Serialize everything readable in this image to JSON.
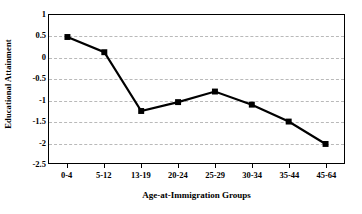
{
  "chart_data": {
    "type": "line",
    "title": "",
    "subtitle": "",
    "xlabel": "Age-at-Immigration Groups",
    "ylabel": "Educational Attainment",
    "categories": [
      "0-4",
      "5-12",
      "13-19",
      "20-24",
      "25-29",
      "30-34",
      "35-44",
      "45-64"
    ],
    "values": [
      0.48,
      0.12,
      -1.27,
      -1.06,
      -0.81,
      -1.12,
      -1.52,
      -2.05
    ],
    "series": [
      {
        "name": "Educational Attainment",
        "values": [
          0.48,
          0.12,
          -1.27,
          -1.06,
          -0.81,
          -1.12,
          -1.52,
          -2.05
        ]
      }
    ],
    "ylim": [
      -2.5,
      1
    ],
    "ytick_labels": [
      "1",
      "0.5",
      "0",
      "-0.5",
      "-1",
      "-1.5",
      "-2",
      "-2.5"
    ],
    "ytick_values": [
      1,
      0.5,
      0,
      -0.5,
      -1,
      -1.5,
      -2,
      -2.5
    ],
    "xlim_categories": 8,
    "grid": {
      "horizontal": true,
      "vertical": false,
      "style": "dashed",
      "color": "#b9b9b9"
    },
    "legend": {
      "visible": false,
      "position": "none",
      "entries": []
    },
    "marker": {
      "shape": "square",
      "color": "#000000",
      "size": 6
    },
    "line": {
      "color": "#000000",
      "width": 2.2
    },
    "plot_border_color": "#000000",
    "background_color": "#ffffff"
  }
}
